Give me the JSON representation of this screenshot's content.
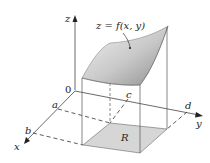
{
  "figure": {
    "surface_label": "z = f(x, y)",
    "region_label": "R",
    "origin_label": "0",
    "axes": {
      "x": "x",
      "y": "y",
      "z": "z"
    },
    "ticks": {
      "a": "a",
      "b": "b",
      "c": "c",
      "d": "d"
    },
    "colors": {
      "surface_light": "#e6e6e6",
      "surface_dark": "#9a9a9a",
      "region_fill": "#d6d6d6",
      "lines": "#555555"
    }
  }
}
